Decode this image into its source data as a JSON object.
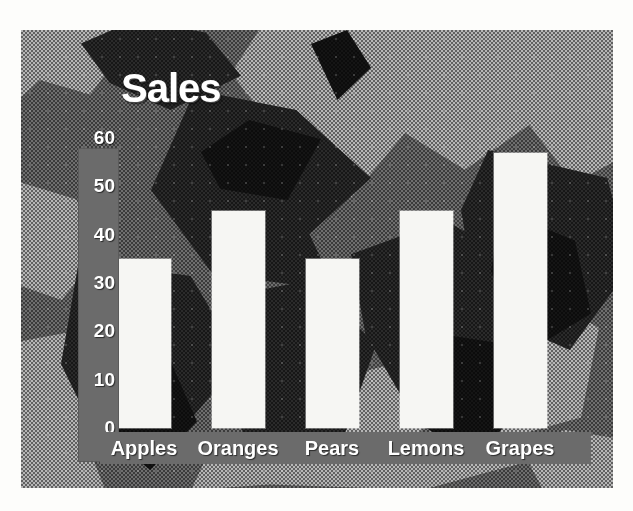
{
  "chart_data": {
    "type": "bar",
    "title": "Sales",
    "xlabel": "",
    "ylabel": "",
    "categories": [
      "Apples",
      "Oranges",
      "Pears",
      "Lemons",
      "Grapes"
    ],
    "values": [
      35,
      45,
      35,
      45,
      57
    ],
    "ylim": [
      0,
      60
    ],
    "ytick_labels": [
      "60",
      "50",
      "40",
      "30",
      "20",
      "10",
      "0"
    ],
    "ytick_values": [
      60,
      50,
      40,
      30,
      20,
      10,
      0
    ],
    "grid": false,
    "legend": false,
    "series": [
      {
        "name": "Sales",
        "values": [
          35,
          45,
          35,
          45,
          57
        ]
      }
    ]
  },
  "style": {
    "bar_color": "#f6f6f3",
    "axis_band_color": "#6b6b6b",
    "text_color": "#ffffff",
    "background_description": "dithered grayscale marble camouflage texture"
  }
}
